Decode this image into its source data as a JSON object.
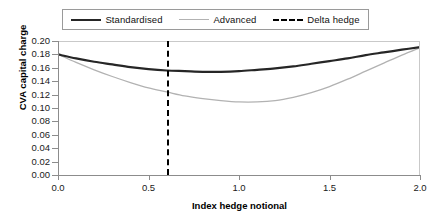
{
  "chart_data": {
    "type": "line",
    "title": "",
    "xlabel": "Index hedge notional",
    "ylabel": "CVA capital charge",
    "xlim": [
      0.0,
      2.0
    ],
    "ylim": [
      0.0,
      0.2
    ],
    "xticks": [
      "0.0",
      "0.5",
      "1.0",
      "1.5",
      "2.0"
    ],
    "xtick_values": [
      0.0,
      0.5,
      1.0,
      1.5,
      2.0
    ],
    "yticks": [
      "0.00",
      "0.02",
      "0.04",
      "0.06",
      "0.08",
      "0.10",
      "0.12",
      "0.14",
      "0.16",
      "0.18",
      "0.20"
    ],
    "ytick_values": [
      0.0,
      0.02,
      0.04,
      0.06,
      0.08,
      0.1,
      0.12,
      0.14,
      0.16,
      0.18,
      0.2
    ],
    "grid": false,
    "legend_position": "top",
    "series": [
      {
        "name": "Standardised",
        "color": "#262626",
        "style": "solid",
        "width": 2.2,
        "x": [
          0.0,
          0.1,
          0.2,
          0.3,
          0.4,
          0.5,
          0.6,
          0.7,
          0.8,
          0.9,
          1.0,
          1.1,
          1.2,
          1.3,
          1.4,
          1.5,
          1.6,
          1.7,
          1.8,
          1.9,
          2.0
        ],
        "y": [
          0.18,
          0.174,
          0.169,
          0.165,
          0.161,
          0.158,
          0.156,
          0.155,
          0.154,
          0.154,
          0.155,
          0.157,
          0.159,
          0.162,
          0.166,
          0.17,
          0.174,
          0.179,
          0.183,
          0.187,
          0.191
        ]
      },
      {
        "name": "Advanced",
        "color": "#b2b2b2",
        "style": "solid",
        "width": 1.3,
        "x": [
          0.0,
          0.1,
          0.2,
          0.3,
          0.4,
          0.5,
          0.6,
          0.7,
          0.8,
          0.9,
          1.0,
          1.1,
          1.2,
          1.3,
          1.4,
          1.5,
          1.6,
          1.7,
          1.8,
          1.9,
          2.0
        ],
        "y": [
          0.18,
          0.168,
          0.157,
          0.147,
          0.138,
          0.13,
          0.124,
          0.118,
          0.114,
          0.111,
          0.109,
          0.109,
          0.111,
          0.116,
          0.123,
          0.132,
          0.143,
          0.155,
          0.167,
          0.179,
          0.19
        ]
      }
    ],
    "annotations": [
      {
        "name": "Delta hedge",
        "type": "vline",
        "x": 0.6,
        "color": "#000000",
        "style": "dashed"
      }
    ]
  },
  "legend": {
    "items": [
      {
        "label": "Standardised",
        "swatch": "solid-dark-line-icon"
      },
      {
        "label": "Advanced",
        "swatch": "solid-light-line-icon"
      },
      {
        "label": "Delta hedge",
        "swatch": "dashed-line-icon"
      }
    ]
  }
}
